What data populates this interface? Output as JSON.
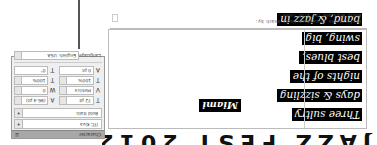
{
  "orientation": "rotated-180",
  "document": {
    "headline_partial": "JAZZ FEST 2012",
    "body_lines": [
      "Three sultry",
      "days & sizzling",
      "nights of the",
      "best blues,",
      "swing, big",
      "band, & jazz in"
    ],
    "city_label": "Miami",
    "caption_lines": [
      "Performances throughout South Beach by:",
      "Boozy Boys and the Blue Tones!"
    ]
  },
  "character_panel": {
    "title": "Character",
    "menu_icon": "panel-menu-icon",
    "font_family": "ITC Kiva",
    "font_style": "Bold Italic",
    "metrics": [
      {
        "icon": "font-size-icon",
        "glyph": "T",
        "value": "72 pt"
      },
      {
        "icon": "leading-icon",
        "glyph": "A",
        "value": "(86.4 pt)"
      },
      {
        "icon": "kerning-icon",
        "glyph": "V",
        "value": "Metrics"
      },
      {
        "icon": "tracking-icon",
        "glyph": "W",
        "value": "0"
      },
      {
        "icon": "vertical-scale-icon",
        "glyph": "T",
        "value": "100%"
      },
      {
        "icon": "horizontal-scale-icon",
        "glyph": "T",
        "value": "100%"
      },
      {
        "icon": "baseline-shift-icon",
        "glyph": "A",
        "value": "0 pt"
      },
      {
        "icon": "skew-icon",
        "glyph": "T",
        "value": "0°"
      }
    ],
    "language_label": "Language:",
    "language_value": "English: USA"
  }
}
